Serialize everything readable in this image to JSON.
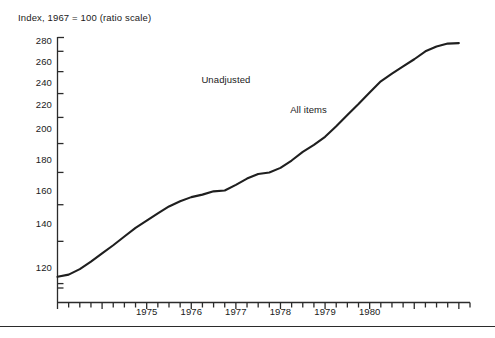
{
  "chart_data": {
    "type": "line",
    "title": "",
    "subtitle": "",
    "ylabel": "Index, 1967 = 100 (ratio scale)",
    "xlabel": "",
    "scale": "log",
    "grid": false,
    "legend_position": "inline-annotations",
    "ylim": [
      112,
      295
    ],
    "xlim": [
      1973.0,
      1982.25
    ],
    "ytick_labels": [
      "280",
      "260",
      "240",
      "220",
      "200",
      "180",
      "160",
      "140",
      "120"
    ],
    "ytick_values": [
      280,
      260,
      240,
      220,
      200,
      180,
      160,
      140,
      120
    ],
    "xtick_labels": [
      "1975",
      "1976",
      "1977",
      "1978",
      "1979",
      "1980",
      "1981",
      "1982"
    ],
    "xtick_values": [
      1975,
      1976,
      1977,
      1978,
      1979,
      1980,
      1981,
      1982
    ],
    "minor_xticks_per_year": 4,
    "annotations": [
      {
        "text": "Unadjusted",
        "x": 1976.9,
        "y": 252
      },
      {
        "text": "All items",
        "x": 1978.8,
        "y": 226
      }
    ],
    "series": [
      {
        "name": "All items",
        "x": [
          1973.0,
          1973.25,
          1973.5,
          1973.75,
          1974.0,
          1974.25,
          1974.5,
          1974.75,
          1975.0,
          1975.25,
          1975.5,
          1975.75,
          1976.0,
          1976.25,
          1976.5,
          1976.75,
          1977.0,
          1977.25,
          1977.5,
          1977.75,
          1978.0,
          1978.25,
          1978.5,
          1978.75,
          1979.0,
          1979.25,
          1979.5,
          1979.75,
          1980.0,
          1980.25,
          1980.5,
          1980.75,
          1981.0,
          1981.25,
          1981.5,
          1981.75,
          1982.0
        ],
        "values": [
          123.0,
          124.0,
          126.5,
          130.0,
          134.0,
          138.0,
          142.5,
          147.0,
          151.0,
          155.0,
          159.0,
          162.0,
          164.5,
          166.0,
          168.0,
          168.5,
          172.0,
          176.0,
          179.0,
          180.0,
          183.0,
          188.0,
          194.0,
          199.0,
          205.0,
          213.0,
          222.0,
          231.0,
          241.0,
          251.0,
          258.0,
          265.0,
          272.0,
          280.0,
          285.0,
          288.0,
          288.5
        ]
      }
    ]
  },
  "colors": {
    "line": "#1f1f1f",
    "axis": "#2b2b2b",
    "text": "#1a1a1a",
    "background": "#ffffff"
  }
}
